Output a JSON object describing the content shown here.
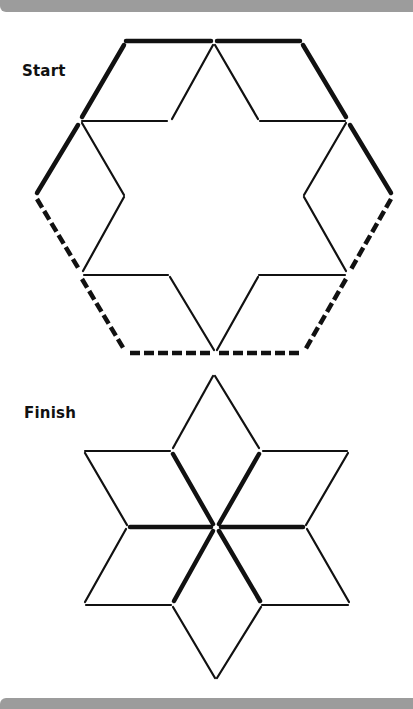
{
  "puzzle": {
    "start": {
      "label": "Start",
      "description": "Hexagon subdivided into six rhombi around a six-pointed star; outer edges shown solid-thick on top half and dashed on bottom half (matchsticks to move)"
    },
    "finish": {
      "label": "Finish",
      "description": "Six-pointed star made of six rhombi meeting at center; thick inner spokes"
    }
  },
  "colors": {
    "band": "#9c9c9c",
    "line": "#111111",
    "background": "#ffffff"
  }
}
